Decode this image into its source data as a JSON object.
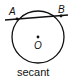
{
  "diagram": {
    "type": "geometry",
    "circle": {
      "center_label": "O",
      "cx": 38,
      "cy": 37,
      "r": 26
    },
    "secant": {
      "from": [
        5,
        20
      ],
      "to": [
        68,
        15
      ],
      "points": [
        {
          "label": "A",
          "x": 17,
          "y": 19
        },
        {
          "label": "B",
          "x": 61,
          "y": 16
        }
      ]
    },
    "labels": {
      "a": "A",
      "b": "B",
      "o": "O"
    },
    "caption": "secant",
    "stroke_color": "#111111"
  }
}
